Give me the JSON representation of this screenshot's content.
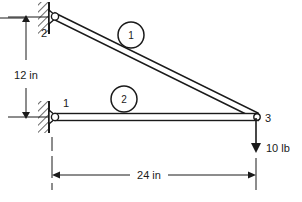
{
  "diagram": {
    "type": "truss-free-body-diagram",
    "background_color": "#ffffff",
    "line_color": "#1a1a1a",
    "nodes": [
      {
        "id": "1",
        "label": "1",
        "x": 52,
        "y": 117,
        "support": "pinned",
        "label_x": 62,
        "label_y": 106
      },
      {
        "id": "2",
        "label": "2",
        "x": 52,
        "y": 17,
        "support": "pinned",
        "label_x": 45,
        "label_y": 33
      },
      {
        "id": "3",
        "label": "3",
        "x": 256,
        "y": 117,
        "support": "free",
        "label_x": 265,
        "label_y": 121
      }
    ],
    "elements": [
      {
        "id": "1",
        "label": "1",
        "from": "2",
        "to": "3",
        "badge_x": 131,
        "badge_y": 35,
        "badge_r": 13
      },
      {
        "id": "2",
        "label": "2",
        "from": "1",
        "to": "3",
        "badge_x": 124,
        "badge_y": 99,
        "badge_r": 13
      }
    ],
    "dimensions": [
      {
        "name": "vertical-height",
        "label": "12 in",
        "value": 12,
        "unit": "in",
        "orientation": "vertical",
        "text_x": 26,
        "text_y": 76,
        "line_x": 26,
        "from_y": 17,
        "to_y": 117
      },
      {
        "name": "horizontal-span",
        "label": "24 in",
        "value": 24,
        "unit": "in",
        "orientation": "horizontal",
        "text_x": 148,
        "text_y": 179,
        "line_y": 175,
        "from_x": 52,
        "to_x": 256
      }
    ],
    "loads": [
      {
        "name": "point-load-node-3",
        "label": "10 lb",
        "value": 10,
        "unit": "lb",
        "direction": "down",
        "at_node": "3",
        "x": 256,
        "from_y": 117,
        "to_y": 150,
        "text_x": 266,
        "text_y": 153
      }
    ]
  }
}
